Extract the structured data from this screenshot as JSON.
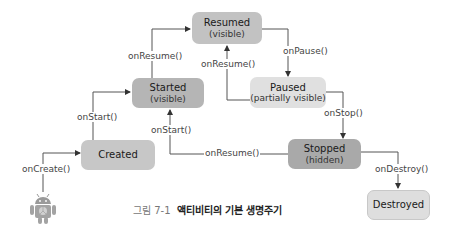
{
  "colors": {
    "dark_box": "#a9a9a9",
    "mid_box": "#c2c2c2",
    "light_box": "#dedede",
    "line": "#555555"
  },
  "states": {
    "resumed": {
      "title": "Resumed",
      "sub": "(visible)"
    },
    "started": {
      "title": "Started",
      "sub": "(visible)"
    },
    "paused": {
      "title": "Paused",
      "sub": "(partially visible)"
    },
    "created": {
      "title": "Created"
    },
    "stopped": {
      "title": "Stopped",
      "sub": "(hidden)"
    },
    "destroyed": {
      "title": "Destroyed"
    }
  },
  "transitions": {
    "on_create": "onCreate()",
    "on_start_created": "onStart()",
    "on_resume_started": "onResume()",
    "on_pause": "onPause()",
    "on_resume_paused": "onResume()",
    "on_stop": "onStop()",
    "on_start_stopped": "onStart()",
    "on_resume_stopped": "onResume()",
    "on_destroy": "onDestroy()"
  },
  "caption": {
    "number": "그림 7-1",
    "text": "액티비티의 기본 생명주기"
  }
}
